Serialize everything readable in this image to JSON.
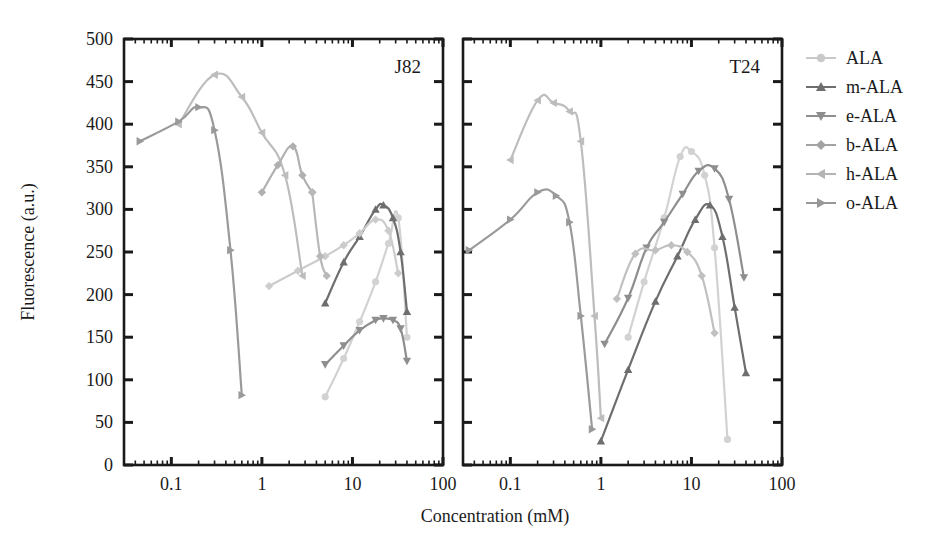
{
  "figure": {
    "width": 950,
    "height": 537,
    "background": "#ffffff",
    "xlabel": "Concentration (mM)",
    "ylabel": "Fluorescence (a.u.)"
  },
  "legend": {
    "position": "right",
    "items": [
      {
        "label": "ALA",
        "marker": "circle",
        "color": "#c9c9c9",
        "icon": "circle-marker-icon"
      },
      {
        "label": "m-ALA",
        "marker": "triangle-up",
        "color": "#6e6e6e",
        "icon": "triangle-up-marker-icon"
      },
      {
        "label": "e-ALA",
        "marker": "triangle-down",
        "color": "#8e8e8e",
        "icon": "triangle-down-marker-icon"
      },
      {
        "label": "b-ALA",
        "marker": "diamond",
        "color": "#a3a3a3",
        "icon": "diamond-marker-icon"
      },
      {
        "label": "h-ALA",
        "marker": "triangle-left",
        "color": "#b4b4b4",
        "icon": "triangle-left-marker-icon"
      },
      {
        "label": "o-ALA",
        "marker": "triangle-right",
        "color": "#989898",
        "icon": "triangle-right-marker-icon"
      }
    ]
  },
  "chart_data": [
    {
      "type": "line",
      "panel": "left",
      "title": "J82",
      "xlabel": "Concentration (mM)",
      "ylabel": "Fluorescence (a.u.)",
      "xscale": "log",
      "xlim": [
        0.03,
        100
      ],
      "ylim": [
        0,
        500
      ],
      "xticks": [
        0.1,
        1,
        10,
        100
      ],
      "xticklabels": [
        "0.1",
        "1",
        "10",
        "100"
      ],
      "yticks": [
        0,
        50,
        100,
        150,
        200,
        250,
        300,
        350,
        400,
        450,
        500
      ],
      "grid": false,
      "series": [
        {
          "name": "ALA",
          "marker": "circle",
          "color": "#d2d2d2",
          "x": [
            5,
            8,
            12,
            18,
            25,
            32,
            40
          ],
          "y": [
            80,
            125,
            168,
            215,
            260,
            290,
            150
          ]
        },
        {
          "name": "m-ALA",
          "marker": "triangle-up",
          "color": "#6e6e6e",
          "x": [
            5,
            8,
            12,
            18,
            22,
            28,
            34,
            40
          ],
          "y": [
            190,
            238,
            268,
            300,
            305,
            290,
            250,
            180
          ]
        },
        {
          "name": "e-ALA",
          "marker": "triangle-down",
          "color": "#8e8e8e",
          "x": [
            5,
            8,
            12,
            18,
            22,
            28,
            34,
            40
          ],
          "y": [
            118,
            140,
            158,
            170,
            172,
            170,
            160,
            122
          ]
        },
        {
          "name": "b-ALA",
          "marker": "diamond",
          "color": "#cccccc",
          "x": [
            1.2,
            2.5,
            5,
            8,
            12,
            18,
            25,
            32
          ],
          "y": [
            210,
            228,
            245,
            258,
            272,
            288,
            275,
            225
          ]
        },
        {
          "name": "h-ALA",
          "marker": "triangle-left",
          "color": "#bdbdbd",
          "x": [
            0.12,
            0.3,
            0.6,
            1.0,
            1.8,
            2.8
          ],
          "y": [
            400,
            458,
            432,
            390,
            340,
            222
          ]
        },
        {
          "name": "o-ALA",
          "marker": "triangle-right",
          "color": "#9a9a9a",
          "x": [
            0.045,
            0.12,
            0.2,
            0.3,
            0.45,
            0.6
          ],
          "y": [
            380,
            403,
            420,
            393,
            252,
            82
          ]
        },
        {
          "name": "b-ALA-branch",
          "marker": "diamond",
          "color": "#b0b0b0",
          "x": [
            1.0,
            1.5,
            2.2,
            2.8,
            3.6
          ],
          "y": [
            320,
            352,
            374,
            340,
            320
          ]
        },
        {
          "name": "b-ALA-tail",
          "marker": "diamond",
          "color": "#b8b8b8",
          "x": [
            3.6,
            4.4,
            5.2
          ],
          "y": [
            320,
            245,
            222
          ]
        }
      ]
    },
    {
      "type": "line",
      "panel": "right",
      "title": "T24",
      "xlabel": "Concentration (mM)",
      "ylabel": "Fluorescence (a.u.)",
      "xscale": "log",
      "xlim": [
        0.03,
        100
      ],
      "ylim": [
        0,
        500
      ],
      "xticks": [
        0.1,
        1,
        10,
        100
      ],
      "xticklabels": [
        "0.1",
        "1",
        "10",
        "100"
      ],
      "yticks": [
        0,
        50,
        100,
        150,
        200,
        250,
        300,
        350,
        400,
        450,
        500
      ],
      "grid": false,
      "series": [
        {
          "name": "ALA",
          "marker": "circle",
          "color": "#d2d2d2",
          "x": [
            2.0,
            3.0,
            5.0,
            7.5,
            10,
            14,
            18,
            25
          ],
          "y": [
            150,
            215,
            290,
            362,
            368,
            340,
            255,
            30
          ]
        },
        {
          "name": "m-ALA",
          "marker": "triangle-up",
          "color": "#6e6e6e",
          "x": [
            1.0,
            2.0,
            4.0,
            7.0,
            11,
            16,
            22,
            30,
            40
          ],
          "y": [
            28,
            112,
            192,
            245,
            288,
            305,
            268,
            185,
            108
          ]
        },
        {
          "name": "e-ALA",
          "marker": "triangle-down",
          "color": "#8e8e8e",
          "x": [
            1.1,
            2.0,
            3.2,
            5.0,
            8.0,
            12,
            18,
            26,
            38
          ],
          "y": [
            142,
            196,
            255,
            285,
            318,
            345,
            348,
            312,
            220
          ]
        },
        {
          "name": "b-ALA",
          "marker": "diamond",
          "color": "#c0c0c0",
          "x": [
            1.5,
            2.4,
            4.0,
            6.0,
            9.0,
            13,
            18
          ],
          "y": [
            195,
            248,
            252,
            258,
            250,
            222,
            155
          ]
        },
        {
          "name": "h-ALA",
          "marker": "triangle-left",
          "color": "#bdbdbd",
          "x": [
            0.1,
            0.2,
            0.3,
            0.45,
            0.6,
            0.85,
            1.0
          ],
          "y": [
            358,
            428,
            425,
            415,
            380,
            175,
            55
          ]
        },
        {
          "name": "o-ALA",
          "marker": "triangle-right",
          "color": "#9a9a9a",
          "x": [
            0.035,
            0.1,
            0.2,
            0.32,
            0.45,
            0.6,
            0.8
          ],
          "y": [
            252,
            288,
            320,
            316,
            285,
            175,
            42
          ]
        }
      ]
    }
  ]
}
